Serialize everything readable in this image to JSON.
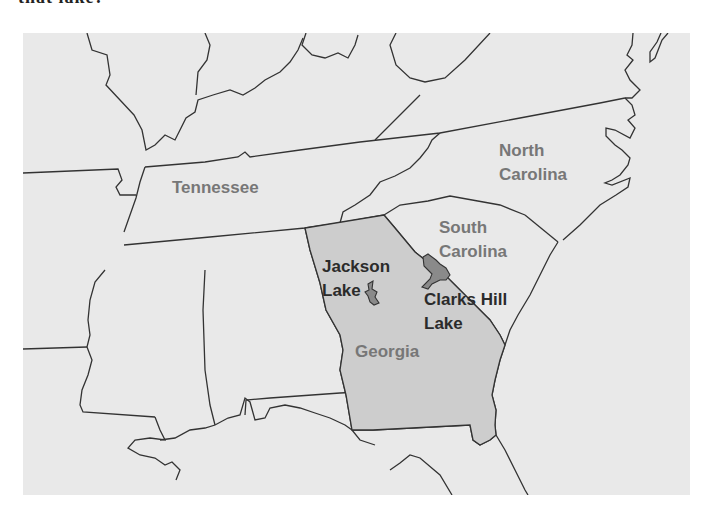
{
  "question": {
    "fragment": "that lake?"
  },
  "map": {
    "colors": {
      "background": "#e9e9e9",
      "georgia_fill": "#cdcdcd",
      "lake_fill": "#8a8a8a",
      "border": "#333333",
      "state_label": "#777777",
      "lake_label": "#2b2b2b"
    },
    "states": {
      "tennessee": "Tennessee",
      "north_carolina_line1": "North",
      "north_carolina_line2": "Carolina",
      "south_carolina_line1": "South",
      "south_carolina_line2": "Carolina",
      "georgia": "Georgia"
    },
    "lakes": {
      "jackson_line1": "Jackson",
      "jackson_line2": "Lake",
      "clarks_hill_line1": "Clarks Hill",
      "clarks_hill_line2": "Lake"
    }
  }
}
